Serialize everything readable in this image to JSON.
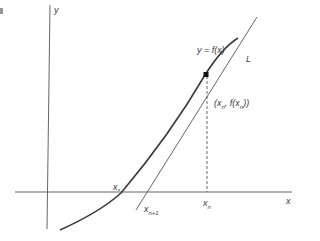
{
  "labels": {
    "y_axis": "y",
    "x_axis": "x",
    "curve": "y = f(x)",
    "tangent": "L",
    "point_open": "(x",
    "point_sub1": "n",
    "point_mid": ", f(x",
    "point_sub2": "n",
    "point_close": "))",
    "root": "x",
    "root_sub": "*",
    "next_iterate": "x",
    "next_iterate_sub": "n+1",
    "current_iterate": "x",
    "current_iterate_sub": "n"
  },
  "colors": {
    "ink": "#3a3a3a",
    "background": "#ffffff"
  }
}
